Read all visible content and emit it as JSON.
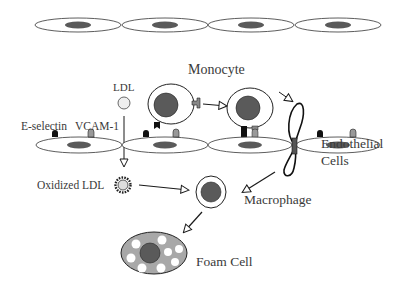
{
  "diagram": {
    "labels": {
      "ldl": "LDL",
      "monocyte": "Monocyte",
      "e_selectin": "E-selectin",
      "vcam1": "VCAM-1",
      "endothelial_line1": "Endothelial",
      "endothelial_line2": "Cells",
      "oxidized_ldl": "Oxidized LDL",
      "macrophage": "Macrophage",
      "foam_cell": "Foam Cell"
    },
    "colors": {
      "nucleus": "#5a5a5a",
      "outline": "#1a1a1a",
      "ldl_fill": "#eeeeee",
      "foam_fill": "#a8a8a8",
      "vcam_fill": "#9a9a9a",
      "eselectin_fill": "#111111"
    },
    "nodes": [
      {
        "id": "ldl",
        "label": "LDL"
      },
      {
        "id": "monocyte",
        "label": "Monocyte"
      },
      {
        "id": "endothelial-cells",
        "label": "Endothelial Cells"
      },
      {
        "id": "oxidized-ldl",
        "label": "Oxidized LDL"
      },
      {
        "id": "macrophage",
        "label": "Macrophage"
      },
      {
        "id": "foam-cell",
        "label": "Foam Cell"
      }
    ],
    "edges": [
      {
        "from": "ldl",
        "to": "oxidized-ldl"
      },
      {
        "from": "monocyte",
        "to": "adherent-monocyte"
      },
      {
        "from": "adherent-monocyte",
        "to": "transmigrating-monocyte"
      },
      {
        "from": "transmigrating-monocyte",
        "to": "macrophage"
      },
      {
        "from": "oxidized-ldl",
        "to": "macrophage"
      },
      {
        "from": "macrophage",
        "to": "foam-cell"
      }
    ]
  }
}
